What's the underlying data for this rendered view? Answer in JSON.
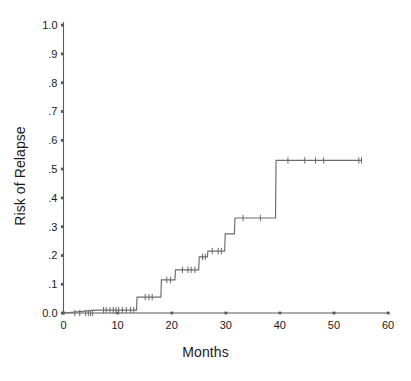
{
  "chart_data": {
    "type": "line",
    "title": "",
    "xlabel": "Months",
    "ylabel": "Risk of Relapse",
    "xlim": [
      0,
      60
    ],
    "ylim": [
      0,
      1.0
    ],
    "grid": false,
    "legend": "none",
    "xticks": [
      0,
      10,
      20,
      30,
      40,
      50,
      60
    ],
    "xtick_labels": [
      "0",
      "10",
      "20",
      "30",
      "40",
      "50",
      "60"
    ],
    "yticks": [
      0.0,
      0.1,
      0.2,
      0.3,
      0.4,
      0.5,
      0.6,
      0.7,
      0.8,
      0.9,
      1.0
    ],
    "ytick_labels": [
      "0.0",
      ".1",
      ".2",
      ".3",
      ".4",
      ".5",
      ".6",
      ".7",
      ".8",
      ".9",
      "1.0"
    ],
    "series": [
      {
        "name": "Risk of Relapse",
        "style": "step-post",
        "color": "#6b6b6b",
        "x": [
          0,
          6,
          13.5,
          14.5,
          18,
          19.5,
          21,
          24.5,
          26,
          28,
          29.5,
          31.5,
          39.5,
          55
        ],
        "y": [
          0.0,
          0.01,
          0.01,
          0.055,
          0.055,
          0.115,
          0.15,
          0.15,
          0.195,
          0.215,
          0.215,
          0.275,
          0.33,
          0.53
        ],
        "steps": [
          {
            "x": 0.0,
            "y": 0.0
          },
          {
            "x": 6.0,
            "y": 0.01
          },
          {
            "x": 13.5,
            "y": 0.01
          },
          {
            "x": 13.6,
            "y": 0.055
          },
          {
            "x": 18.0,
            "y": 0.055
          },
          {
            "x": 18.1,
            "y": 0.115
          },
          {
            "x": 20.6,
            "y": 0.115
          },
          {
            "x": 20.7,
            "y": 0.15
          },
          {
            "x": 25.0,
            "y": 0.15
          },
          {
            "x": 25.1,
            "y": 0.195
          },
          {
            "x": 26.6,
            "y": 0.195
          },
          {
            "x": 26.7,
            "y": 0.215
          },
          {
            "x": 29.8,
            "y": 0.215
          },
          {
            "x": 29.9,
            "y": 0.275
          },
          {
            "x": 31.6,
            "y": 0.275
          },
          {
            "x": 31.7,
            "y": 0.33
          },
          {
            "x": 39.2,
            "y": 0.33
          },
          {
            "x": 39.3,
            "y": 0.53
          },
          {
            "x": 55.2,
            "y": 0.53
          }
        ],
        "censor_marks": [
          {
            "x": 2.1,
            "y": 0.0
          },
          {
            "x": 3.0,
            "y": 0.0
          },
          {
            "x": 4.1,
            "y": 0.0
          },
          {
            "x": 4.6,
            "y": 0.0
          },
          {
            "x": 5.0,
            "y": 0.0
          },
          {
            "x": 5.4,
            "y": 0.0
          },
          {
            "x": 7.4,
            "y": 0.01
          },
          {
            "x": 7.9,
            "y": 0.01
          },
          {
            "x": 8.6,
            "y": 0.01
          },
          {
            "x": 9.2,
            "y": 0.01
          },
          {
            "x": 9.7,
            "y": 0.01
          },
          {
            "x": 10.2,
            "y": 0.01
          },
          {
            "x": 10.9,
            "y": 0.01
          },
          {
            "x": 11.6,
            "y": 0.01
          },
          {
            "x": 12.4,
            "y": 0.01
          },
          {
            "x": 13.0,
            "y": 0.01
          },
          {
            "x": 15.1,
            "y": 0.055
          },
          {
            "x": 15.8,
            "y": 0.055
          },
          {
            "x": 16.4,
            "y": 0.055
          },
          {
            "x": 19.1,
            "y": 0.115
          },
          {
            "x": 19.8,
            "y": 0.115
          },
          {
            "x": 22.0,
            "y": 0.15
          },
          {
            "x": 23.0,
            "y": 0.15
          },
          {
            "x": 23.6,
            "y": 0.15
          },
          {
            "x": 24.3,
            "y": 0.15
          },
          {
            "x": 25.7,
            "y": 0.195
          },
          {
            "x": 26.2,
            "y": 0.195
          },
          {
            "x": 27.5,
            "y": 0.215
          },
          {
            "x": 28.6,
            "y": 0.215
          },
          {
            "x": 29.2,
            "y": 0.215
          },
          {
            "x": 33.2,
            "y": 0.33
          },
          {
            "x": 36.4,
            "y": 0.33
          },
          {
            "x": 41.5,
            "y": 0.53
          },
          {
            "x": 44.6,
            "y": 0.53
          },
          {
            "x": 46.6,
            "y": 0.53
          },
          {
            "x": 48.1,
            "y": 0.53
          },
          {
            "x": 54.6,
            "y": 0.53
          },
          {
            "x": 55.1,
            "y": 0.53
          }
        ]
      }
    ]
  },
  "axis_color": "#5a5a5a",
  "text_color": "#1a1a1a"
}
